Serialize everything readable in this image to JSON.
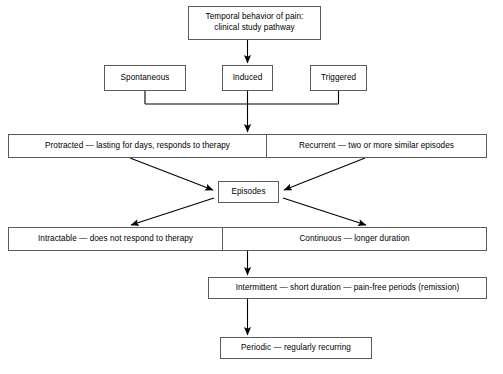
{
  "diagram": {
    "title": "Temporal behavior of pain: clinical study pathway",
    "nodes": {
      "root": "Temporal behavior of pain:\nclinical study pathway",
      "spontaneous": "Spontaneous",
      "induced": "Induced",
      "triggered": "Triggered",
      "protracted": "Protracted — lasting for days, responds to therapy",
      "recurrent": "Recurrent — two or more similar episodes",
      "episodes": "Episodes",
      "intractable": "Intractable — does not respond to therapy",
      "continuous": "Continuous — longer duration",
      "intermittent": "Intermittent — short duration — pain-free periods (remission)",
      "periodic": "Periodic — regularly recurring"
    },
    "colors": {
      "box_border": "#5b5b5b",
      "edge": "#000000",
      "background": "#ffffff",
      "text": "#000000"
    },
    "caption": ""
  }
}
